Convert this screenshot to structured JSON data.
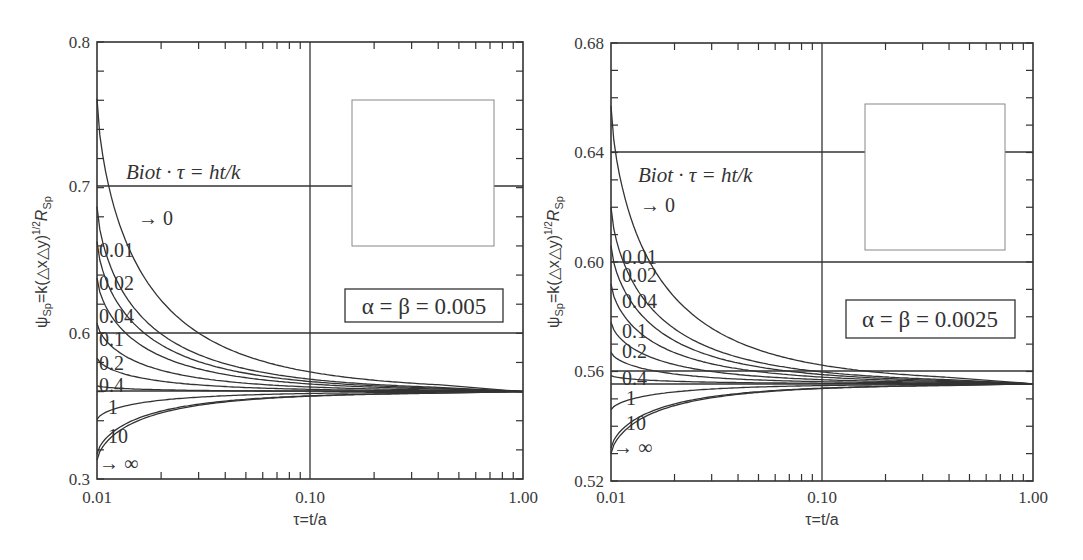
{
  "chart_data": [
    {
      "type": "line",
      "title": "",
      "xlabel": "τ=t/a",
      "ylabel": "ψSp=k(△x△y)^1/2 RSp",
      "xscale": "log",
      "xlim": [
        0.01,
        1.0
      ],
      "ylim": [
        0.5,
        0.8
      ],
      "x_ticks": [
        "0.01",
        "0.10",
        "1.00"
      ],
      "y_ticks": [
        {
          "value": 0.5,
          "label": "0.3"
        },
        {
          "value": 0.6,
          "label": "0.6"
        },
        {
          "value": 0.7,
          "label": "0.7"
        },
        {
          "value": 0.8,
          "label": "0.8"
        }
      ],
      "gridlines": {
        "x": [
          0.1
        ],
        "y": [
          0.6,
          0.7,
          0.56
        ]
      },
      "annotation": "Biot · τ = ht/k",
      "parameter_box": "α = β = 0.005",
      "inset_box": true,
      "asymptote": 0.56,
      "legend_param": "Biot·τ",
      "series": [
        {
          "name": "→ 0",
          "start": 0.761
        },
        {
          "name": "0.01",
          "start": 0.687
        },
        {
          "name": "0.02",
          "start": 0.663
        },
        {
          "name": "0.04",
          "start": 0.638
        },
        {
          "name": "0.1",
          "start": 0.607
        },
        {
          "name": "0.2",
          "start": 0.583
        },
        {
          "name": "0.4",
          "start": 0.564
        },
        {
          "name": "1",
          "start": 0.541
        },
        {
          "name": "10",
          "start": 0.517
        },
        {
          "name": "→ ∞",
          "start": 0.513
        }
      ]
    },
    {
      "type": "line",
      "title": "",
      "xlabel": "τ=t/a",
      "ylabel": "ψSp=k(△x△y)^1/2 RSp",
      "xscale": "log",
      "xlim": [
        0.01,
        1.0
      ],
      "ylim": [
        0.52,
        0.68
      ],
      "x_ticks": [
        "0.01",
        "0.10",
        "1.00"
      ],
      "y_ticks": [
        {
          "value": 0.52,
          "label": "0.52"
        },
        {
          "value": 0.56,
          "label": "0.56"
        },
        {
          "value": 0.6,
          "label": "0.60"
        },
        {
          "value": 0.64,
          "label": "0.64"
        },
        {
          "value": 0.68,
          "label": "0.68"
        }
      ],
      "gridlines": {
        "x": [
          0.1
        ],
        "y": [
          0.64,
          0.6,
          0.56,
          0.5555
        ]
      },
      "annotation": "Biot · τ = ht/k",
      "parameter_box": "α = β = 0.0025",
      "inset_box": true,
      "asymptote": 0.5555,
      "legend_param": "Biot·τ",
      "series": [
        {
          "name": "→ 0",
          "start": 0.657
        },
        {
          "name": "0.01",
          "start": 0.62
        },
        {
          "name": "0.02",
          "start": 0.606
        },
        {
          "name": "0.04",
          "start": 0.592
        },
        {
          "name": "0.1",
          "start": 0.578
        },
        {
          "name": "0.2",
          "start": 0.567
        },
        {
          "name": "0.4",
          "start": 0.5585
        },
        {
          "name": "1",
          "start": 0.546
        },
        {
          "name": "10",
          "start": 0.532
        },
        {
          "name": "→ ∞",
          "start": 0.53
        }
      ]
    }
  ],
  "left": {
    "y_axis_title_main": "ψ",
    "y_axis_title_sub": "Sp",
    "y_axis_title_mid": "=k(△x△y)",
    "y_axis_title_sup": "1/2",
    "y_axis_title_r": "R",
    "y_axis_title_rsub": "Sp",
    "x_axis_title": "τ=t/a",
    "x_tick_labels": [
      "0.01",
      "0.10",
      "1.00"
    ],
    "y_tick_labels": [
      "0.8",
      "0.7",
      "0.6",
      "0.3"
    ],
    "annotation": "Biot · τ = ht/k",
    "parameter_box": "α = β = 0.005",
    "curve_labels": [
      "→ 0",
      "0.01",
      "0.02",
      "0.04",
      "0.1",
      "0.2",
      "0.4",
      "1",
      "10",
      "→ ∞"
    ]
  },
  "right": {
    "y_axis_title_main": "ψ",
    "y_axis_title_sub": "Sp",
    "y_axis_title_mid": "=k(△x△y)",
    "y_axis_title_sup": "1/2",
    "y_axis_title_r": "R",
    "y_axis_title_rsub": "Sp",
    "x_axis_title": "τ=t/a",
    "x_tick_labels": [
      "0.01",
      "0.10",
      "1.00"
    ],
    "y_tick_labels": [
      "0.68",
      "0.64",
      "0.60",
      "0.56",
      "0.52"
    ],
    "annotation": "Biot · τ = ht/k",
    "parameter_box": "α = β = 0.0025",
    "curve_labels": [
      "→ 0",
      "0.01",
      "0.02",
      "0.04",
      "0.1",
      "0.2",
      "0.4",
      "1",
      "10",
      "→ ∞"
    ]
  }
}
